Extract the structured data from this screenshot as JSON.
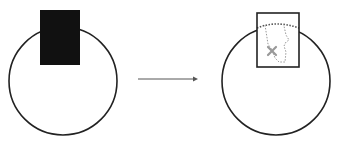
{
  "diagram": {
    "colors": {
      "stroke": "#222222",
      "fill_solid": "#111111",
      "dotted": "#888888",
      "x_mark": "#999999",
      "background": "#ffffff"
    },
    "left": {
      "circle": {
        "cx": 63,
        "cy": 81,
        "r": 54
      },
      "rect": {
        "x": 40,
        "y": 10,
        "w": 40,
        "h": 55,
        "style": "filled-black"
      }
    },
    "arrow": {
      "x1": 138,
      "y1": 79,
      "x2": 198,
      "y2": 79
    },
    "right": {
      "circle": {
        "cx": 276,
        "cy": 81,
        "r": 54
      },
      "rect": {
        "x": 257,
        "y": 13,
        "w": 42,
        "h": 54,
        "style": "outline"
      },
      "x_mark": {
        "cx": 272,
        "cy": 51
      }
    }
  }
}
